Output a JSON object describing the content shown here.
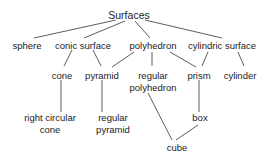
{
  "diagram": {
    "root": "Surfaces",
    "nodes": {
      "sphere": "sphere",
      "conic_surface": "conic surface",
      "polyhedron": "polyhedron",
      "cylindric_surface": "cylindric surface",
      "cone": "cone",
      "pyramid": "pyramid",
      "regular_polyhedron_l1": "regular",
      "regular_polyhedron_l2": "polyhedron",
      "prism": "prism",
      "cylinder": "cylinder",
      "right_circular_cone_l1": "right circular",
      "right_circular_cone_l2": "cone",
      "regular_pyramid_l1": "regular",
      "regular_pyramid_l2": "pyramid",
      "box": "box",
      "cube": "cube"
    },
    "edges": [
      [
        "Surfaces",
        "sphere"
      ],
      [
        "Surfaces",
        "conic surface"
      ],
      [
        "Surfaces",
        "polyhedron"
      ],
      [
        "Surfaces",
        "cylindric surface"
      ],
      [
        "conic surface",
        "cone"
      ],
      [
        "conic surface",
        "pyramid"
      ],
      [
        "polyhedron",
        "pyramid"
      ],
      [
        "polyhedron",
        "regular polyhedron"
      ],
      [
        "polyhedron",
        "prism"
      ],
      [
        "cylindric surface",
        "prism"
      ],
      [
        "cylindric surface",
        "cylinder"
      ],
      [
        "cone",
        "right circular cone"
      ],
      [
        "pyramid",
        "regular pyramid"
      ],
      [
        "regular polyhedron",
        "cube"
      ],
      [
        "prism",
        "box"
      ],
      [
        "box",
        "cube"
      ]
    ]
  }
}
